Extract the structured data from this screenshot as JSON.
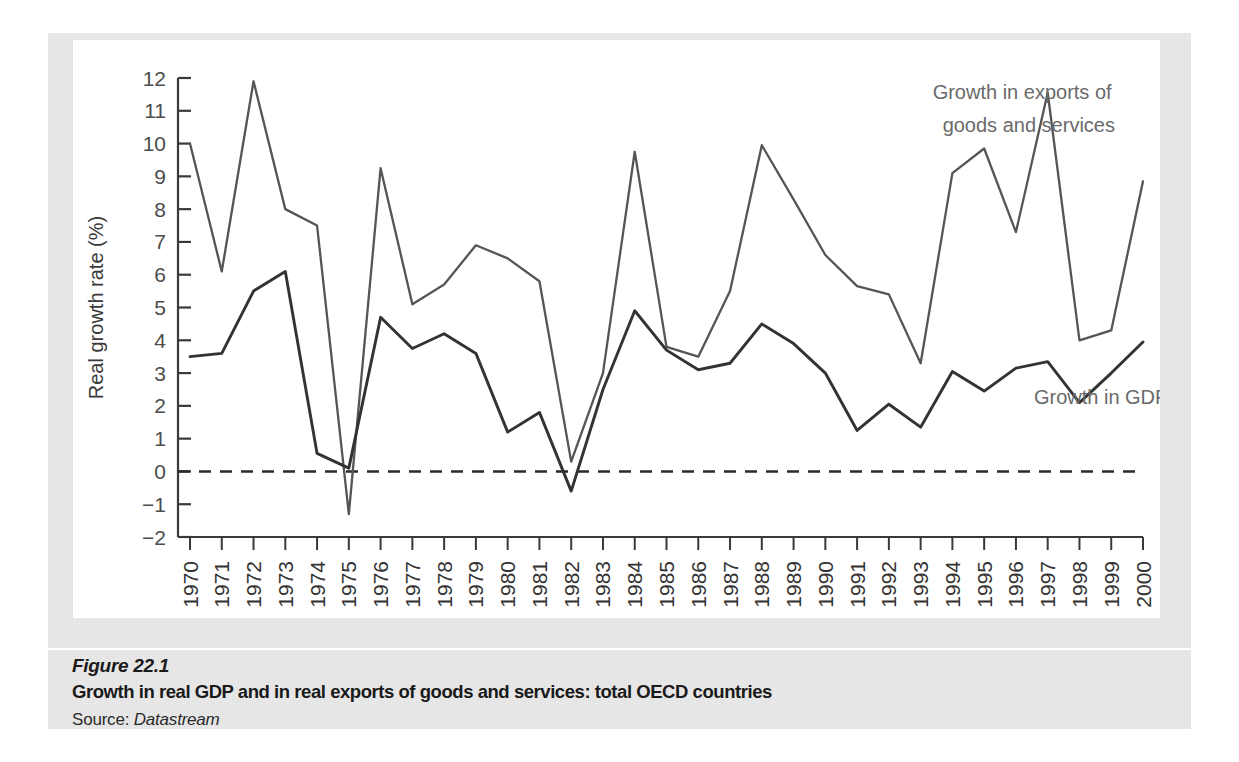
{
  "figure": {
    "number": "Figure 22.1",
    "title": "Growth in real GDP and in real exports of goods and services: total OECD countries",
    "source_prefix": "Source: ",
    "source_name": "Datastream"
  },
  "chart_data": {
    "type": "line",
    "title": "",
    "xlabel": "",
    "ylabel": "Real growth rate (%)",
    "ylim": [
      -2,
      12
    ],
    "ytick_step": 1,
    "yticks": [
      -2,
      -1,
      0,
      1,
      2,
      3,
      4,
      5,
      6,
      7,
      8,
      9,
      10,
      11,
      12
    ],
    "ytick_labels": [
      "−2",
      "−1",
      "0",
      "1",
      "2",
      "3",
      "4",
      "5",
      "6",
      "7",
      "8",
      "9",
      "10",
      "11",
      "12"
    ],
    "grid": false,
    "zero_line": true,
    "zero_line_style": "dashed",
    "legend": "annotations",
    "x": [
      1970,
      1971,
      1972,
      1973,
      1974,
      1975,
      1976,
      1977,
      1978,
      1979,
      1980,
      1981,
      1982,
      1983,
      1984,
      1985,
      1986,
      1987,
      1988,
      1989,
      1990,
      1991,
      1992,
      1993,
      1994,
      1995,
      1996,
      1997,
      1998,
      1999,
      2000
    ],
    "categories": [
      "1970",
      "1971",
      "1972",
      "1973",
      "1974",
      "1975",
      "1976",
      "1977",
      "1978",
      "1979",
      "1980",
      "1981",
      "1982",
      "1983",
      "1984",
      "1985",
      "1986",
      "1987",
      "1988",
      "1989",
      "1990",
      "1991",
      "1992",
      "1993",
      "1994",
      "1995",
      "1996",
      "1997",
      "1998",
      "1999",
      "2000"
    ],
    "series": [
      {
        "name": "Growth in exports of goods and services",
        "color": "#555555",
        "label_line1": "Growth in exports of",
        "label_line2": "goods and services",
        "values": [
          10.0,
          6.1,
          11.9,
          8.0,
          7.5,
          -1.3,
          9.25,
          5.1,
          5.7,
          6.9,
          6.5,
          5.8,
          0.3,
          3.0,
          9.75,
          3.8,
          3.5,
          5.5,
          9.95,
          8.3,
          6.6,
          5.65,
          5.4,
          3.3,
          9.1,
          9.85,
          7.3,
          11.55,
          4.0,
          4.3,
          8.85
        ]
      },
      {
        "name": "Growth in GDP",
        "color": "#333333",
        "label_line1": "Growth in GDP",
        "values": [
          3.5,
          3.6,
          5.5,
          6.1,
          0.55,
          0.1,
          4.7,
          3.75,
          4.2,
          3.6,
          1.2,
          1.8,
          -0.6,
          2.5,
          4.9,
          3.7,
          3.1,
          3.3,
          4.5,
          3.9,
          3.0,
          1.25,
          2.05,
          1.35,
          3.05,
          2.45,
          3.15,
          3.35,
          2.1,
          3.0,
          3.95
        ]
      }
    ],
    "annotations": [
      {
        "text": "Growth in exports of goods and services",
        "x": 1993,
        "y": 11.2
      },
      {
        "text": "Growth in GDP",
        "x": 1997,
        "y": 2.2
      }
    ]
  }
}
